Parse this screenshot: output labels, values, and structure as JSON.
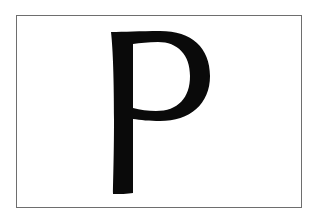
{
  "card": {
    "letter": "P",
    "border_color": "#6e6e6e",
    "letter_color": "#0a0a0a",
    "background": "#ffffff"
  }
}
